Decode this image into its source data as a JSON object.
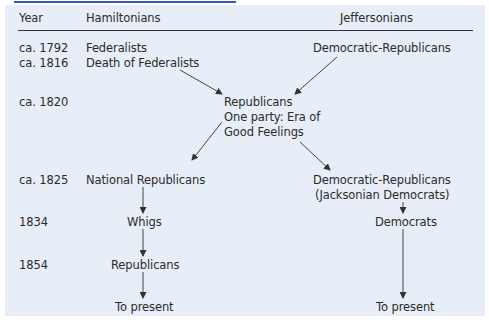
{
  "header": {
    "year": "Year",
    "left": "Hamiltonians",
    "right": "Jeffersonians"
  },
  "rows": [
    {
      "year": "ca. 1792",
      "left": "Federalists",
      "right": "Democratic-Republicans"
    },
    {
      "year": "ca. 1816",
      "left": "Death of Federalists"
    },
    {
      "year": "ca. 1820",
      "center": [
        "Republicans",
        "One party: Era of",
        "Good Feelings"
      ]
    },
    {
      "year": "ca. 1825",
      "left": "National Republicans",
      "right": [
        "Democratic-Republicans",
        "(Jacksonian Democrats)"
      ]
    },
    {
      "year": "1834",
      "left": "Whigs",
      "right": "Democrats"
    },
    {
      "year": "1854",
      "left": "Republicans"
    },
    {
      "year": "",
      "left": "To present",
      "right": "To present"
    }
  ],
  "colors": {
    "panel": "#e7eef8",
    "accent": "#3a58b8",
    "text": "#2b2b2b"
  }
}
